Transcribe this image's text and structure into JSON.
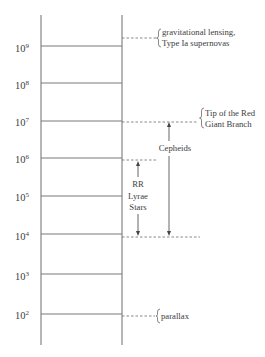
{
  "diagram": {
    "axis": {
      "ticks": [
        {
          "base": "10",
          "exp": "9"
        },
        {
          "base": "10",
          "exp": "8"
        },
        {
          "base": "10",
          "exp": "7"
        },
        {
          "base": "10",
          "exp": "6"
        },
        {
          "base": "10",
          "exp": "5"
        },
        {
          "base": "10",
          "exp": "4"
        },
        {
          "base": "10",
          "exp": "3"
        },
        {
          "base": "10",
          "exp": "2"
        }
      ]
    },
    "annotations": {
      "gravitational": {
        "lines": [
          "gravitational lensing,",
          "Type Ia supernovas"
        ]
      },
      "trgb": {
        "lines": [
          "Tip of the Red",
          "Giant Branch"
        ]
      },
      "cepheids": {
        "label": "Cepheids",
        "range": [
          "10^4",
          "10^7"
        ]
      },
      "rr_lyrae": {
        "lines": [
          "RR",
          "Lyrae",
          "Stars"
        ],
        "range": [
          "10^4",
          "10^6"
        ]
      },
      "parallax": {
        "label": "parallax"
      }
    },
    "colors": {
      "line": "#7a7a7a",
      "text": "#3d3d3d",
      "background": "#ffffff"
    }
  }
}
